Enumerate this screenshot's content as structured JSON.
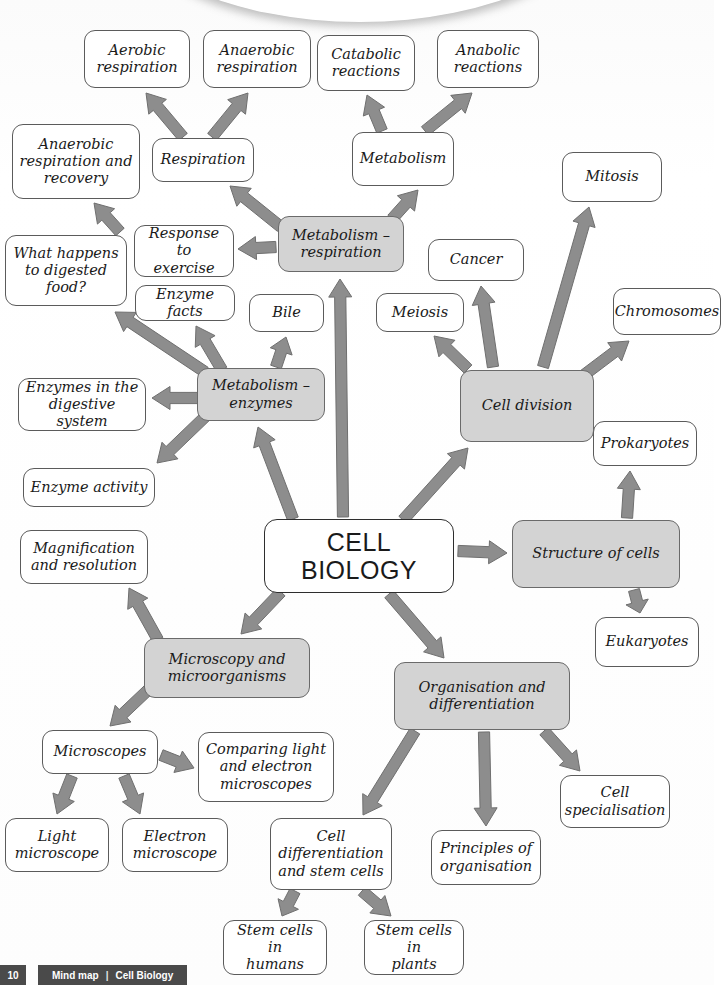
{
  "page": {
    "colors": {
      "shaded_node_fill": "#d3d3d3",
      "plain_node_fill": "#ffffff",
      "node_border": "#5b5b5b",
      "arrow_fill": "#8d8d8d",
      "arrow_stroke": "#6f6f6f",
      "footer_bar": "#4a4a4a",
      "text": "#1a1a1a"
    }
  },
  "footer": {
    "page_number": "10",
    "label": "Mind map",
    "separator": "|",
    "subject": "Cell Biology"
  },
  "nodes": [
    {
      "id": "aerobic-respiration",
      "label": "Aerobic\nrespiration",
      "shaded": false,
      "x": 84,
      "y": 30,
      "w": 106,
      "h": 58
    },
    {
      "id": "anaerobic-respiration",
      "label": "Anaerobic\nrespiration",
      "shaded": false,
      "x": 203,
      "y": 30,
      "w": 108,
      "h": 58
    },
    {
      "id": "catabolic-reactions",
      "label": "Catabolic\nreactions",
      "shaded": false,
      "x": 317,
      "y": 35,
      "w": 98,
      "h": 56
    },
    {
      "id": "anabolic-reactions",
      "label": "Anabolic\nreactions",
      "shaded": false,
      "x": 437,
      "y": 30,
      "w": 102,
      "h": 58
    },
    {
      "id": "anaerobic-respiration-recovery",
      "label": "Anaerobic\nrespiration and\nrecovery",
      "shaded": false,
      "x": 12,
      "y": 124,
      "w": 128,
      "h": 75
    },
    {
      "id": "respiration",
      "label": "Respiration",
      "shaded": false,
      "x": 152,
      "y": 138,
      "w": 102,
      "h": 44
    },
    {
      "id": "metabolism",
      "label": "Metabolism",
      "shaded": false,
      "x": 352,
      "y": 132,
      "w": 102,
      "h": 54
    },
    {
      "id": "mitosis",
      "label": "Mitosis",
      "shaded": false,
      "x": 562,
      "y": 152,
      "w": 100,
      "h": 50
    },
    {
      "id": "metabolism-respiration",
      "label": "Metabolism –\nrespiration",
      "shaded": true,
      "x": 278,
      "y": 216,
      "w": 126,
      "h": 56
    },
    {
      "id": "cancer",
      "label": "Cancer",
      "shaded": false,
      "x": 428,
      "y": 239,
      "w": 96,
      "h": 42
    },
    {
      "id": "response-to-exercise",
      "label": "Response to\nexercise",
      "shaded": false,
      "x": 134,
      "y": 225,
      "w": 100,
      "h": 52
    },
    {
      "id": "what-happens-digested-food",
      "label": "What happens\nto digested\nfood?",
      "shaded": false,
      "x": 5,
      "y": 235,
      "w": 122,
      "h": 71
    },
    {
      "id": "enzyme-facts",
      "label": "Enzyme facts",
      "shaded": false,
      "x": 135,
      "y": 285,
      "w": 100,
      "h": 36
    },
    {
      "id": "bile",
      "label": "Bile",
      "shaded": false,
      "x": 249,
      "y": 294,
      "w": 75,
      "h": 38
    },
    {
      "id": "meiosis",
      "label": "Meiosis",
      "shaded": false,
      "x": 376,
      "y": 293,
      "w": 88,
      "h": 39
    },
    {
      "id": "chromosomes",
      "label": "Chromosomes",
      "shaded": false,
      "x": 613,
      "y": 288,
      "w": 108,
      "h": 47
    },
    {
      "id": "metabolism-enzymes",
      "label": "Metabolism –\nenzymes",
      "shaded": true,
      "x": 197,
      "y": 368,
      "w": 128,
      "h": 53
    },
    {
      "id": "cell-division",
      "label": "Cell division",
      "shaded": true,
      "x": 460,
      "y": 370,
      "w": 134,
      "h": 72
    },
    {
      "id": "enzymes-digestive-system",
      "label": "Enzymes in the\ndigestive system",
      "shaded": false,
      "x": 18,
      "y": 378,
      "w": 128,
      "h": 53
    },
    {
      "id": "prokaryotes",
      "label": "Prokaryotes",
      "shaded": false,
      "x": 593,
      "y": 421,
      "w": 104,
      "h": 45
    },
    {
      "id": "enzyme-activity",
      "label": "Enzyme activity",
      "shaded": false,
      "x": 23,
      "y": 468,
      "w": 132,
      "h": 39
    },
    {
      "id": "magnification-resolution",
      "label": "Magnification\nand resolution",
      "shaded": false,
      "x": 20,
      "y": 530,
      "w": 128,
      "h": 54
    },
    {
      "id": "cell-biology",
      "label": "CELL\nBIOLOGY",
      "shaded": false,
      "x": 264,
      "y": 519,
      "w": 190,
      "h": 74,
      "center": true
    },
    {
      "id": "structure-of-cells",
      "label": "Structure of cells",
      "shaded": true,
      "x": 512,
      "y": 520,
      "w": 168,
      "h": 68
    },
    {
      "id": "eukaryotes",
      "label": "Eukaryotes",
      "shaded": false,
      "x": 595,
      "y": 617,
      "w": 104,
      "h": 50
    },
    {
      "id": "microscopy-microorganisms",
      "label": "Microscopy and\nmicroorganisms",
      "shaded": true,
      "x": 144,
      "y": 638,
      "w": 166,
      "h": 60
    },
    {
      "id": "organisation-differentiation",
      "label": "Organisation and\ndifferentiation",
      "shaded": true,
      "x": 394,
      "y": 662,
      "w": 176,
      "h": 68
    },
    {
      "id": "microscopes",
      "label": "Microscopes",
      "shaded": false,
      "x": 42,
      "y": 730,
      "w": 116,
      "h": 44
    },
    {
      "id": "comparing-light-electron-microscopes",
      "label": "Comparing light\nand electron\nmicroscopes",
      "shaded": false,
      "x": 198,
      "y": 732,
      "w": 136,
      "h": 70
    },
    {
      "id": "cell-differentiation-stem-cells",
      "label": "Cell\ndifferentiation\nand stem cells",
      "shaded": false,
      "x": 270,
      "y": 818,
      "w": 122,
      "h": 72
    },
    {
      "id": "cell-specialisation",
      "label": "Cell\nspecialisation",
      "shaded": false,
      "x": 560,
      "y": 775,
      "w": 110,
      "h": 53
    },
    {
      "id": "principles-of-organisation",
      "label": "Principles of\norganisation",
      "shaded": false,
      "x": 431,
      "y": 830,
      "w": 110,
      "h": 55
    },
    {
      "id": "light-microscope",
      "label": "Light\nmicroscope",
      "shaded": false,
      "x": 5,
      "y": 818,
      "w": 104,
      "h": 54
    },
    {
      "id": "electron-microscope",
      "label": "Electron\nmicroscope",
      "shaded": false,
      "x": 122,
      "y": 818,
      "w": 106,
      "h": 54
    },
    {
      "id": "stem-cells-in-humans",
      "label": "Stem cells in\nhumans",
      "shaded": false,
      "x": 223,
      "y": 920,
      "w": 104,
      "h": 55
    },
    {
      "id": "stem-cells-in-plants",
      "label": "Stem cells in\nplants",
      "shaded": false,
      "x": 364,
      "y": 920,
      "w": 100,
      "h": 55
    }
  ],
  "arrows": [
    {
      "id": "respiration-to-aerobic",
      "from": "respiration",
      "to": "aerobic-respiration",
      "x1": 183,
      "y1": 137,
      "x2": 146,
      "y2": 93
    },
    {
      "id": "respiration-to-anaerobic",
      "from": "respiration",
      "to": "anaerobic-respiration",
      "x1": 212,
      "y1": 137,
      "x2": 248,
      "y2": 93
    },
    {
      "id": "metabolism-to-catabolic",
      "from": "metabolism",
      "to": "catabolic-reactions",
      "x1": 382,
      "y1": 131,
      "x2": 367,
      "y2": 95
    },
    {
      "id": "metabolism-to-anabolic",
      "from": "metabolism",
      "to": "anabolic-reactions",
      "x1": 425,
      "y1": 131,
      "x2": 472,
      "y2": 93
    },
    {
      "id": "metabolism-respiration-to-respiration",
      "from": "metabolism-respiration",
      "to": "respiration",
      "x1": 281,
      "y1": 227,
      "x2": 230,
      "y2": 186
    },
    {
      "id": "metabolism-respiration-to-metabolism",
      "from": "metabolism-respiration",
      "to": "metabolism",
      "x1": 392,
      "y1": 219,
      "x2": 418,
      "y2": 190
    },
    {
      "id": "metabolism-respiration-to-response",
      "from": "metabolism-respiration",
      "to": "response-to-exercise",
      "x1": 276,
      "y1": 247,
      "x2": 238,
      "y2": 249
    },
    {
      "id": "response-to-anaerobic-recovery",
      "from": "response-to-exercise",
      "to": "anaerobic-respiration-recovery",
      "x1": 120,
      "y1": 232,
      "x2": 94,
      "y2": 203
    },
    {
      "id": "metabolism-enzymes-to-what-happens",
      "from": "metabolism-enzymes",
      "to": "what-happens-digested-food",
      "x1": 205,
      "y1": 372,
      "x2": 115,
      "y2": 312
    },
    {
      "id": "metabolism-enzymes-to-enzyme-facts",
      "from": "metabolism-enzymes",
      "to": "enzyme-facts",
      "x1": 222,
      "y1": 370,
      "x2": 196,
      "y2": 326
    },
    {
      "id": "metabolism-enzymes-to-bile",
      "from": "metabolism-enzymes",
      "to": "bile",
      "x1": 276,
      "y1": 367,
      "x2": 286,
      "y2": 337
    },
    {
      "id": "metabolism-enzymes-to-digestive",
      "from": "metabolism-enzymes",
      "to": "enzymes-digestive-system",
      "x1": 199,
      "y1": 398,
      "x2": 152,
      "y2": 398
    },
    {
      "id": "metabolism-enzymes-to-enzyme-activity",
      "from": "metabolism-enzymes",
      "to": "enzyme-activity",
      "x1": 208,
      "y1": 414,
      "x2": 157,
      "y2": 463
    },
    {
      "id": "cell-biology-to-metabolism-enzymes",
      "from": "cell-biology",
      "to": "metabolism-enzymes",
      "x1": 293,
      "y1": 519,
      "x2": 258,
      "y2": 427
    },
    {
      "id": "cell-biology-to-metabolism-respiration",
      "from": "cell-biology",
      "to": "metabolism-respiration",
      "x1": 343,
      "y1": 517,
      "x2": 340,
      "y2": 279
    },
    {
      "id": "cell-biology-to-cell-division",
      "from": "cell-biology",
      "to": "cell-division",
      "x1": 403,
      "y1": 520,
      "x2": 468,
      "y2": 448
    },
    {
      "id": "cell-division-to-meiosis",
      "from": "cell-division",
      "to": "meiosis",
      "x1": 468,
      "y1": 369,
      "x2": 434,
      "y2": 336
    },
    {
      "id": "cell-division-to-cancer",
      "from": "cell-division",
      "to": "cancer",
      "x1": 493,
      "y1": 367,
      "x2": 481,
      "y2": 286
    },
    {
      "id": "cell-division-to-mitosis",
      "from": "cell-division",
      "to": "mitosis",
      "x1": 543,
      "y1": 367,
      "x2": 589,
      "y2": 207
    },
    {
      "id": "cell-division-to-chromosomes",
      "from": "cell-division",
      "to": "chromosomes",
      "x1": 580,
      "y1": 378,
      "x2": 629,
      "y2": 341
    },
    {
      "id": "cell-biology-to-structure",
      "from": "cell-biology",
      "to": "structure-of-cells",
      "x1": 458,
      "y1": 551,
      "x2": 507,
      "y2": 553
    },
    {
      "id": "structure-to-prokaryotes",
      "from": "structure-of-cells",
      "to": "prokaryotes",
      "x1": 627,
      "y1": 518,
      "x2": 630,
      "y2": 471
    },
    {
      "id": "structure-to-eukaryotes",
      "from": "structure-of-cells",
      "to": "eukaryotes",
      "x1": 634,
      "y1": 590,
      "x2": 640,
      "y2": 613
    },
    {
      "id": "cell-biology-to-microscopy",
      "from": "cell-biology",
      "to": "microscopy-microorganisms",
      "x1": 281,
      "y1": 592,
      "x2": 241,
      "y2": 634
    },
    {
      "id": "microscopy-to-magnification",
      "from": "microscopy-microorganisms",
      "to": "magnification-resolution",
      "x1": 158,
      "y1": 640,
      "x2": 129,
      "y2": 588
    },
    {
      "id": "microscopy-to-microscopes",
      "from": "microscopy-microorganisms",
      "to": "microscopes",
      "x1": 148,
      "y1": 690,
      "x2": 110,
      "y2": 726
    },
    {
      "id": "microscopes-to-comparing",
      "from": "microscopes",
      "to": "comparing-light-electron-microscopes",
      "x1": 161,
      "y1": 755,
      "x2": 194,
      "y2": 768
    },
    {
      "id": "microscopes-to-light",
      "from": "microscopes",
      "to": "light-microscope",
      "x1": 72,
      "y1": 776,
      "x2": 57,
      "y2": 814
    },
    {
      "id": "microscopes-to-electron",
      "from": "microscopes",
      "to": "electron-microscope",
      "x1": 124,
      "y1": 776,
      "x2": 140,
      "y2": 814
    },
    {
      "id": "cell-biology-to-organisation",
      "from": "cell-biology",
      "to": "organisation-differentiation",
      "x1": 389,
      "y1": 594,
      "x2": 444,
      "y2": 658
    },
    {
      "id": "organisation-to-cell-diff",
      "from": "organisation-differentiation",
      "to": "cell-differentiation-stem-cells",
      "x1": 415,
      "y1": 731,
      "x2": 363,
      "y2": 815
    },
    {
      "id": "organisation-to-principles",
      "from": "organisation-differentiation",
      "to": "principles-of-organisation",
      "x1": 484,
      "y1": 732,
      "x2": 486,
      "y2": 826
    },
    {
      "id": "organisation-to-specialisation",
      "from": "organisation-differentiation",
      "to": "cell-specialisation",
      "x1": 544,
      "y1": 731,
      "x2": 580,
      "y2": 771
    },
    {
      "id": "cell-diff-to-stem-humans",
      "from": "cell-differentiation-stem-cells",
      "to": "stem-cells-in-humans",
      "x1": 295,
      "y1": 891,
      "x2": 282,
      "y2": 916
    },
    {
      "id": "cell-diff-to-stem-plants",
      "from": "cell-differentiation-stem-cells",
      "to": "stem-cells-in-plants",
      "x1": 362,
      "y1": 891,
      "x2": 391,
      "y2": 916
    }
  ]
}
